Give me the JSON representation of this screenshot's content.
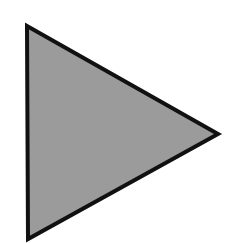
{
  "shape": {
    "type": "triangle",
    "orientation": "right-pointing",
    "points": [
      [
        27,
        26
      ],
      [
        218,
        134
      ],
      [
        28,
        239
      ]
    ],
    "fill": "#9b9b9b",
    "stroke": "#111111",
    "stroke_width": 4
  },
  "background": "#ffffff"
}
